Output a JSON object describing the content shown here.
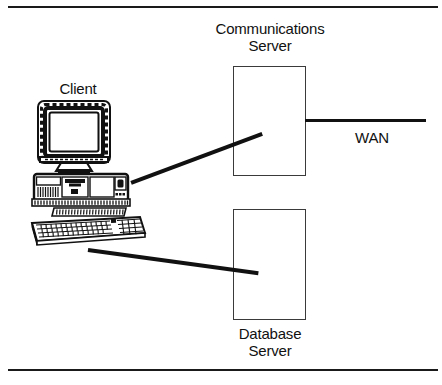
{
  "figure": {
    "type": "network-topology-diagram",
    "background": "#ffffff",
    "line_color": "#111111",
    "box_stroke": "#3a3a3a",
    "rules": {
      "top": "horizontal-rule",
      "bottom": "horizontal-rule"
    }
  },
  "nodes": {
    "client": {
      "label": "Client",
      "icon": "desktop-computer-icon",
      "parts": [
        "crt-monitor",
        "system-unit",
        "keyboard"
      ]
    },
    "comms_server": {
      "label": "Communications\nServer",
      "shape": "rectangle"
    },
    "database_server": {
      "label": "Database\nServer",
      "shape": "rectangle"
    },
    "wan": {
      "label": "WAN"
    }
  },
  "links": [
    {
      "name": "client-to-communications-server",
      "from": "client",
      "to": "comms_server"
    },
    {
      "name": "client-to-database-server",
      "from": "client",
      "to": "database_server"
    },
    {
      "name": "communications-server-to-wan",
      "from": "comms_server",
      "to": "wan"
    }
  ]
}
